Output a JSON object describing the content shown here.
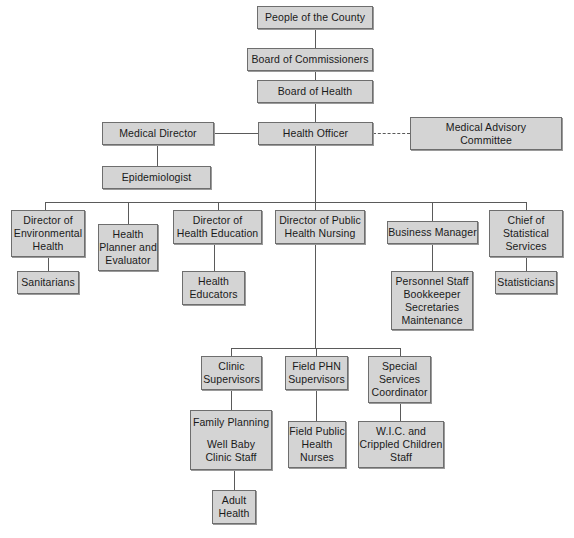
{
  "diagram": {
    "style": {
      "box_fill": "#d4d4d4",
      "box_border": "#6e6e6e",
      "line_color": "#5a5a5a",
      "background": "#ffffff",
      "text_color": "#1a1a1a"
    },
    "nodes": [
      {
        "id": "people",
        "lines": [
          "People of the County"
        ],
        "x": 257,
        "y": 6,
        "w": 116,
        "h": 23
      },
      {
        "id": "commissioners",
        "lines": [
          "Board of Commissioners"
        ],
        "x": 247,
        "y": 48,
        "w": 126,
        "h": 23
      },
      {
        "id": "board_health",
        "lines": [
          "Board of Health"
        ],
        "x": 257,
        "y": 80,
        "w": 116,
        "h": 23
      },
      {
        "id": "medical_director",
        "lines": [
          "Medical Director"
        ],
        "x": 102,
        "y": 122,
        "w": 112,
        "h": 23
      },
      {
        "id": "health_officer",
        "lines": [
          "Health Officer"
        ],
        "x": 258,
        "y": 122,
        "w": 115,
        "h": 23
      },
      {
        "id": "medical_advisory",
        "lines": [
          "Medical Advisory",
          "Committee"
        ],
        "x": 410,
        "y": 117,
        "w": 152,
        "h": 33
      },
      {
        "id": "epidemiologist",
        "lines": [
          "Epidemiologist"
        ],
        "x": 102,
        "y": 166,
        "w": 109,
        "h": 23
      },
      {
        "id": "dir_env_health",
        "lines": [
          "Director of",
          "Environmental",
          "Health"
        ],
        "x": 11,
        "y": 210,
        "w": 74,
        "h": 47
      },
      {
        "id": "health_planner",
        "lines": [
          "Health",
          "Planner and",
          "Evaluator"
        ],
        "x": 98,
        "y": 224,
        "w": 60,
        "h": 47
      },
      {
        "id": "dir_health_ed",
        "lines": [
          "Director of",
          "Health Education"
        ],
        "x": 173,
        "y": 210,
        "w": 89,
        "h": 34
      },
      {
        "id": "dir_phn",
        "lines": [
          "Director of Public",
          "Health Nursing"
        ],
        "x": 275,
        "y": 210,
        "w": 90,
        "h": 34
      },
      {
        "id": "business_manager",
        "lines": [
          "Business Manager"
        ],
        "x": 387,
        "y": 221,
        "w": 91,
        "h": 23
      },
      {
        "id": "chief_stat",
        "lines": [
          "Chief of",
          "Statistical",
          "Services"
        ],
        "x": 489,
        "y": 210,
        "w": 74,
        "h": 47
      },
      {
        "id": "sanitarians",
        "lines": [
          "Sanitarians"
        ],
        "x": 17,
        "y": 271,
        "w": 62,
        "h": 23
      },
      {
        "id": "health_educators",
        "lines": [
          "Health",
          "Educators"
        ],
        "x": 182,
        "y": 271,
        "w": 63,
        "h": 34
      },
      {
        "id": "personnel",
        "lines": [
          "Personnel Staff",
          "Bookkeeper",
          "Secretaries",
          "Maintenance"
        ],
        "x": 391,
        "y": 271,
        "w": 82,
        "h": 59
      },
      {
        "id": "statisticians",
        "lines": [
          "Statisticians"
        ],
        "x": 495,
        "y": 271,
        "w": 62,
        "h": 23
      },
      {
        "id": "clinic_sup",
        "lines": [
          "Clinic",
          "Supervisors"
        ],
        "x": 201,
        "y": 356,
        "w": 61,
        "h": 34
      },
      {
        "id": "field_phn_sup",
        "lines": [
          "Field PHN",
          "Supervisors"
        ],
        "x": 285,
        "y": 356,
        "w": 63,
        "h": 34
      },
      {
        "id": "special_services",
        "lines": [
          "Special",
          "Services",
          "Coordinator"
        ],
        "x": 368,
        "y": 356,
        "w": 63,
        "h": 47
      },
      {
        "id": "family_planning",
        "lines": [
          "Family Planning",
          "",
          "Well Baby",
          "Clinic Staff"
        ],
        "x": 190,
        "y": 410,
        "w": 82,
        "h": 60
      },
      {
        "id": "field_nurses",
        "lines": [
          "Field Public",
          "Health",
          "Nurses"
        ],
        "x": 288,
        "y": 421,
        "w": 58,
        "h": 47
      },
      {
        "id": "wic",
        "lines": [
          "W.I.C. and",
          "Crippled Children",
          "Staff"
        ],
        "x": 358,
        "y": 421,
        "w": 86,
        "h": 47
      },
      {
        "id": "adult_health",
        "lines": [
          "Adult",
          "Health"
        ],
        "x": 212,
        "y": 490,
        "w": 44,
        "h": 34
      }
    ],
    "edges": [
      {
        "id": "people-to-commissioners",
        "type": "v",
        "x": 315,
        "y": 29,
        "len": 19
      },
      {
        "id": "commissioners-to-board",
        "type": "v",
        "x": 315,
        "y": 71,
        "len": 9
      },
      {
        "id": "board-to-officer",
        "type": "v",
        "x": 315,
        "y": 103,
        "len": 19
      },
      {
        "id": "officer-to-director",
        "type": "h",
        "x": 214,
        "y": 133,
        "len": 44
      },
      {
        "id": "director-to-epidemiologist",
        "type": "v",
        "x": 157,
        "y": 145,
        "len": 21
      },
      {
        "id": "officer-to-advisory",
        "type": "dashed-h",
        "x": 373,
        "y": 133,
        "len": 37
      },
      {
        "id": "officer-down-to-bus",
        "type": "v",
        "x": 315,
        "y": 145,
        "len": 57
      },
      {
        "id": "tier3-bus",
        "type": "h",
        "x": 45,
        "y": 202,
        "len": 481
      },
      {
        "id": "drop-env",
        "type": "v",
        "x": 45,
        "y": 202,
        "len": 8
      },
      {
        "id": "drop-planner",
        "type": "v",
        "x": 128,
        "y": 202,
        "len": 22
      },
      {
        "id": "drop-healthed",
        "type": "v",
        "x": 218,
        "y": 202,
        "len": 8
      },
      {
        "id": "drop-phn",
        "type": "v",
        "x": 315,
        "y": 202,
        "len": 8
      },
      {
        "id": "drop-bizmgr",
        "type": "v",
        "x": 432,
        "y": 202,
        "len": 19
      },
      {
        "id": "drop-chiefstat",
        "type": "v",
        "x": 526,
        "y": 202,
        "len": 8
      },
      {
        "id": "env-to-sanitarians",
        "type": "v",
        "x": 48,
        "y": 257,
        "len": 14
      },
      {
        "id": "healthed-to-educators",
        "type": "v",
        "x": 214,
        "y": 244,
        "len": 27
      },
      {
        "id": "bizmgr-to-personnel",
        "type": "v",
        "x": 432,
        "y": 244,
        "len": 27
      },
      {
        "id": "chief-to-statisticians",
        "type": "v",
        "x": 526,
        "y": 257,
        "len": 14
      },
      {
        "id": "phn-trunk",
        "type": "v",
        "x": 315,
        "y": 244,
        "len": 104
      },
      {
        "id": "tier4-bus",
        "type": "h",
        "x": 231,
        "y": 348,
        "len": 169
      },
      {
        "id": "drop-clinic",
        "type": "v",
        "x": 231,
        "y": 348,
        "len": 8
      },
      {
        "id": "drop-fieldphn",
        "type": "v",
        "x": 316,
        "y": 348,
        "len": 8
      },
      {
        "id": "drop-special",
        "type": "v",
        "x": 400,
        "y": 348,
        "len": 8
      },
      {
        "id": "clinic-to-family",
        "type": "v",
        "x": 231,
        "y": 390,
        "len": 20
      },
      {
        "id": "fieldphn-to-nurses",
        "type": "v",
        "x": 316,
        "y": 390,
        "len": 31
      },
      {
        "id": "special-to-wic",
        "type": "v",
        "x": 400,
        "y": 403,
        "len": 18
      },
      {
        "id": "family-to-adult",
        "type": "v",
        "x": 234,
        "y": 470,
        "len": 20
      }
    ]
  }
}
